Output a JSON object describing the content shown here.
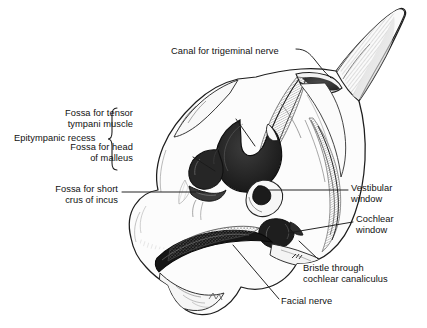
{
  "figure": {
    "background_color": "#ffffff",
    "ink_color": "#1a1a1a",
    "bone_fill": "#fbfbfb",
    "cavity_fill": "#2a2a2a",
    "shading_gray": "#9a9a9a"
  },
  "labels": [
    {
      "id": "canal-trigeminal-nerve",
      "text": "Canal for trigeminal nerve",
      "align": "left",
      "x": 171,
      "y": 46,
      "leader": "curved hook to superior petrous surface"
    },
    {
      "id": "fossa-tensor-tympani",
      "text": "Fossa for tensor\ntympani muscle",
      "align": "right",
      "x": 133,
      "y": 108,
      "leader": "straight line down-right into epitympanic cavity"
    },
    {
      "id": "fossa-head-of-malleus",
      "text": "Fossa for head\nof malleus",
      "align": "right",
      "x": 133,
      "y": 142,
      "leader": "straight line down-right to dark recess"
    },
    {
      "id": "fossa-short-crus-incus",
      "text": "Fossa for short\ncrus of incus",
      "align": "right",
      "x": 118,
      "y": 184,
      "leader": "horizontal line right to incus fossa"
    },
    {
      "id": "vestibular-window",
      "text": "Vestibular\nwindow",
      "align": "left",
      "x": 351,
      "y": 183,
      "leader": "long horizontal line left to oval window"
    },
    {
      "id": "cochlear-window",
      "text": "Cochlear\nwindow",
      "align": "left",
      "x": 356,
      "y": 214,
      "leader": "line left-down to round window"
    },
    {
      "id": "bristle-cochlear-canaliculus",
      "text": "Bristle through\ncochlear canaliculus",
      "align": "left",
      "x": 303,
      "y": 263,
      "leader": "line up-left to bristle"
    },
    {
      "id": "facial-nerve",
      "text": "Facial nerve",
      "align": "left",
      "x": 281,
      "y": 296,
      "leader": "long line up-left to facial canal groove"
    }
  ],
  "brace_group": {
    "id": "epitympanic-recess",
    "text": "Epitympanic recess",
    "x": 14,
    "y": 133,
    "brace_x": 113,
    "brace_top": 107,
    "brace_bottom": 171,
    "members": [
      "fossa-tensor-tympani",
      "fossa-head-of-malleus"
    ]
  }
}
